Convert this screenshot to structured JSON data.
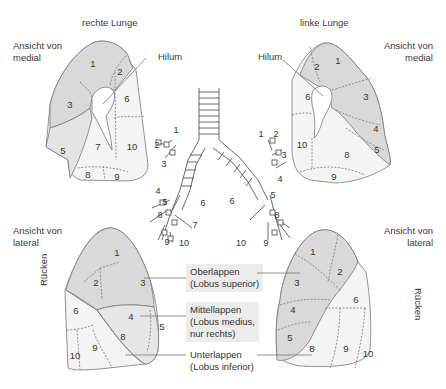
{
  "titles": {
    "right_lung": "rechte Lunge",
    "left_lung": "linke Lunge"
  },
  "views": {
    "medial_left": [
      "Ansicht von",
      "medial"
    ],
    "medial_right": [
      "Ansicht von",
      "medial"
    ],
    "lateral_left": [
      "Ansicht von",
      "lateral"
    ],
    "lateral_right": [
      "Ansicht von",
      "lateral"
    ]
  },
  "hilum_labels": {
    "right": "Hilum",
    "left": "Hilum"
  },
  "back_labels": {
    "right_lateral": "Rücken",
    "left_lateral": "Rücken"
  },
  "lobes": {
    "upper": [
      "Oberlappen",
      "(Lobus superior)"
    ],
    "middle": [
      "Mittellappen",
      "(Lobus medius,",
      "nur rechts)"
    ],
    "lower": [
      "Unterlappen",
      "(Lobus inferior)"
    ]
  },
  "colors": {
    "dark_fill": "#d9d9d9",
    "light_fill": "#f4f4f4",
    "outline": "#777777",
    "lobe_box": "#ececec"
  },
  "segments": {
    "right_medial": [
      "1",
      "2",
      "3",
      "5",
      "6",
      "7",
      "8",
      "9",
      "10"
    ],
    "left_medial": [
      "1",
      "2",
      "3",
      "4",
      "5",
      "6",
      "8",
      "9",
      "10"
    ],
    "right_lateral": [
      "1",
      "2",
      "3",
      "4",
      "5",
      "6",
      "8",
      "9",
      "10"
    ],
    "left_lateral": [
      "1",
      "2",
      "3",
      "4",
      "5",
      "6",
      "8",
      "9",
      "10"
    ]
  },
  "bronchi": {
    "right": [
      "1",
      "2",
      "3",
      "4",
      "5",
      "8",
      "6",
      "7",
      "9",
      "10"
    ],
    "left": [
      "1",
      "2",
      "3",
      "4",
      "5",
      "6",
      "8",
      "10",
      "9"
    ]
  }
}
